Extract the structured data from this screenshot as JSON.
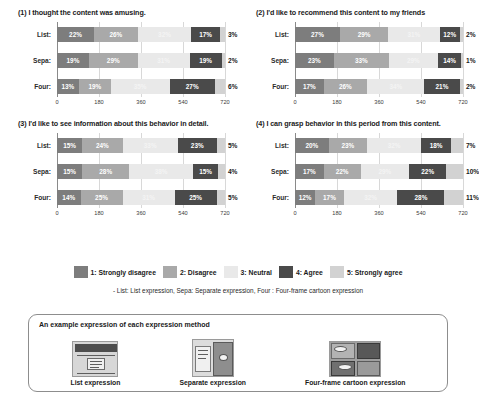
{
  "chart_data": [
    {
      "type": "bar",
      "title": "(1) I thought the content was amusing.",
      "orientation": "horizontal",
      "stacked": true,
      "xlabel": "",
      "ylabel": "",
      "xlim": [
        0,
        720
      ],
      "xticks": [
        "0",
        "180",
        "360",
        "540",
        "720"
      ],
      "categories": [
        "List:",
        "Sepa:",
        "Four:"
      ],
      "series": [
        {
          "name": "1: Strongly disagree",
          "values": [
            22,
            19,
            13
          ]
        },
        {
          "name": "2: Disagree",
          "values": [
            26,
            29,
            19
          ]
        },
        {
          "name": "3: Neutral",
          "values": [
            32,
            31,
            35
          ]
        },
        {
          "name": "4: Agree",
          "values": [
            17,
            19,
            27
          ]
        },
        {
          "name": "5: Strongly agree",
          "values": [
            3,
            2,
            6
          ]
        }
      ],
      "grid": true,
      "legend_position": "bottom-shared"
    },
    {
      "type": "bar",
      "title": "(2) I'd like to recommend this content to my friends",
      "orientation": "horizontal",
      "stacked": true,
      "xlabel": "",
      "ylabel": "",
      "xlim": [
        0,
        720
      ],
      "xticks": [
        "0",
        "180",
        "360",
        "540",
        "720"
      ],
      "categories": [
        "List:",
        "Sepa:",
        "Four:"
      ],
      "series": [
        {
          "name": "1: Strongly disagree",
          "values": [
            27,
            23,
            17
          ]
        },
        {
          "name": "2: Disagree",
          "values": [
            29,
            33,
            26
          ]
        },
        {
          "name": "3: Neutral",
          "values": [
            31,
            29,
            34
          ]
        },
        {
          "name": "4: Agree",
          "values": [
            12,
            14,
            21
          ]
        },
        {
          "name": "5: Strongly agree",
          "values": [
            2,
            1,
            2
          ]
        }
      ],
      "grid": true,
      "legend_position": "bottom-shared"
    },
    {
      "type": "bar",
      "title": "(3) I'd like to see information about this behavior in detail.",
      "orientation": "horizontal",
      "stacked": true,
      "xlabel": "",
      "ylabel": "",
      "xlim": [
        0,
        720
      ],
      "xticks": [
        "0",
        "180",
        "360",
        "540",
        "720"
      ],
      "categories": [
        "List:",
        "Sepa:",
        "Four:"
      ],
      "series": [
        {
          "name": "1: Strongly disagree",
          "values": [
            15,
            15,
            14
          ]
        },
        {
          "name": "2: Disagree",
          "values": [
            24,
            28,
            25
          ]
        },
        {
          "name": "3: Neutral",
          "values": [
            33,
            38,
            31
          ]
        },
        {
          "name": "4: Agree",
          "values": [
            23,
            15,
            25
          ]
        },
        {
          "name": "5: Strongly agree",
          "values": [
            5,
            4,
            5
          ]
        }
      ],
      "grid": true,
      "legend_position": "bottom-shared"
    },
    {
      "type": "bar",
      "title": "(4) I can grasp behavior in this period from this content.",
      "orientation": "horizontal",
      "stacked": true,
      "xlabel": "",
      "ylabel": "",
      "xlim": [
        0,
        720
      ],
      "xticks": [
        "0",
        "180",
        "360",
        "540",
        "720"
      ],
      "categories": [
        "List:",
        "Sepa:",
        "Four:"
      ],
      "series": [
        {
          "name": "1: Strongly disagree",
          "values": [
            20,
            17,
            12
          ]
        },
        {
          "name": "2: Disagree",
          "values": [
            23,
            22,
            17
          ]
        },
        {
          "name": "3: Neutral",
          "values": [
            32,
            29,
            32
          ]
        },
        {
          "name": "4: Agree",
          "values": [
            18,
            22,
            28
          ]
        },
        {
          "name": "5: Strongly agree",
          "values": [
            7,
            10,
            11
          ]
        }
      ],
      "grid": true,
      "legend_position": "bottom-shared"
    }
  ],
  "legend": {
    "items": [
      {
        "label": "1: Strongly disagree",
        "color": "#7d7d7d"
      },
      {
        "label": "2: Disagree",
        "color": "#a9a9a9"
      },
      {
        "label": "3: Neutral",
        "color": "#e9e9e9"
      },
      {
        "label": "4: Agree",
        "color": "#4a4a4a"
      },
      {
        "label": "5: Strongly agree",
        "color": "#d2d2d2"
      }
    ],
    "note": "- List: List expression, Sepa: Separate expression, Four : Four-frame cartoon expression"
  },
  "example_panel": {
    "heading": "An example expression of each expression method",
    "items": [
      {
        "caption": "List expression"
      },
      {
        "caption": "Separate expression"
      },
      {
        "caption": "Four-frame cartoon expression"
      }
    ]
  }
}
